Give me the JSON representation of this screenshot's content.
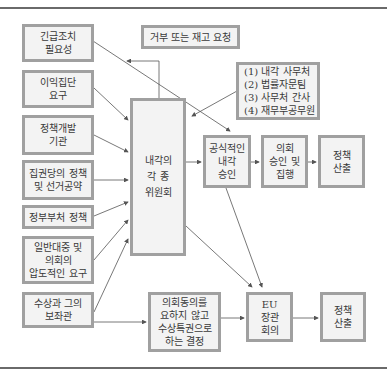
{
  "diagram": {
    "inputs": [
      {
        "id": "urgent",
        "lines": [
          "긴급조치",
          "필요성"
        ]
      },
      {
        "id": "interest",
        "lines": [
          "이익집단",
          "요구"
        ]
      },
      {
        "id": "policy-dev",
        "lines": [
          "정책개발",
          "기관"
        ]
      },
      {
        "id": "ruling-party",
        "lines": [
          "집권당의 정책",
          "및 선거공약"
        ]
      },
      {
        "id": "ministry",
        "lines": [
          "정부부처 정책"
        ]
      },
      {
        "id": "public",
        "lines": [
          "일반대중 및",
          "의회의",
          "압도적인 요구"
        ]
      },
      {
        "id": "pm",
        "lines": [
          "수상과 그의",
          "보좌관"
        ]
      }
    ],
    "reject_box": {
      "lines": [
        "거부 또는 재고 요청"
      ]
    },
    "support_box": {
      "lines": [
        "(1) 내각 사무처",
        "(2) 법률자문팀",
        "(3) 사무처 간사",
        "(4) 재무부공무원"
      ]
    },
    "committee": {
      "lines": [
        "내각의",
        "각  종",
        "위원회"
      ]
    },
    "cabinet_approval": {
      "lines": [
        "공식적인",
        "내각",
        "승인"
      ]
    },
    "parliament": {
      "lines": [
        "의회",
        "승인 및",
        "집행"
      ]
    },
    "output_top": {
      "lines": [
        "정책",
        "산출"
      ]
    },
    "prerogative": {
      "lines": [
        "의회동의를",
        "요하지 않고",
        "수상특권으로",
        "하는 결정"
      ]
    },
    "eu_council": {
      "lines": [
        "EU",
        "장관",
        "회의"
      ]
    },
    "output_bottom": {
      "lines": [
        "정책",
        "산출"
      ]
    }
  },
  "colors": {
    "box_border": "#a0a0a0",
    "box_fill": "#f3f3f3",
    "line": "#555555",
    "rule": "#6a6a6a"
  }
}
